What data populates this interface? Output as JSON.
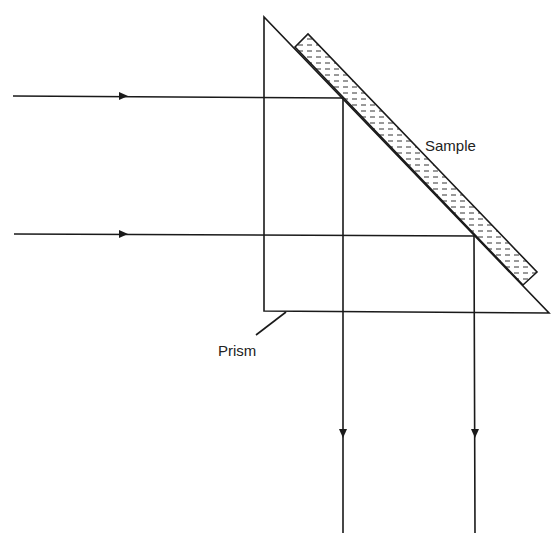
{
  "figure": {
    "type": "optical-schematic"
  },
  "labels": {
    "sample": "Sample",
    "prism": "Prism"
  },
  "colors": {
    "line": "#1a1a1a",
    "background": "#ffffff"
  },
  "geometry": {
    "prism": {
      "top": [
        264,
        17
      ],
      "bottom_left": [
        264,
        311
      ],
      "bottom_right": [
        549,
        313
      ]
    },
    "sample_strip": {
      "corners": [
        [
          295,
          47
        ],
        [
          308,
          34
        ],
        [
          537,
          272
        ],
        [
          523,
          285
        ]
      ]
    },
    "beams": [
      {
        "name": "beam-1",
        "start": [
          13,
          96
        ],
        "reflect": [
          343,
          98
        ],
        "end": [
          343,
          533
        ],
        "arrow_in_x": 124,
        "arrow_out_y": 434
      },
      {
        "name": "beam-2",
        "start": [
          14,
          234
        ],
        "reflect": [
          474,
          236
        ],
        "end": [
          475,
          533
        ],
        "arrow_in_x": 124,
        "arrow_out_y": 434
      }
    ],
    "prism_leader": {
      "from": [
        286,
        312
      ],
      "to": [
        256,
        335
      ]
    }
  }
}
